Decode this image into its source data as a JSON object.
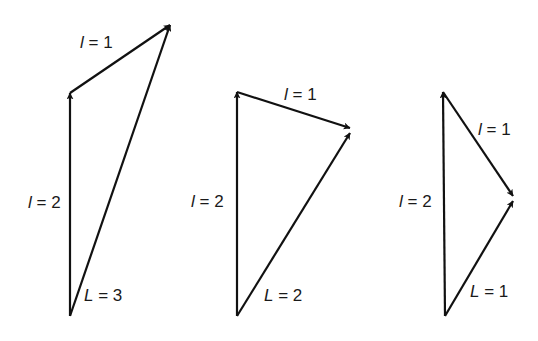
{
  "diagrams": [
    {
      "id": "d1",
      "vectors": [
        {
          "name": "l2",
          "symbol": "l",
          "value": "2",
          "from": [
            70,
            316
          ],
          "to": [
            70,
            93
          ]
        },
        {
          "name": "l1",
          "symbol": "l",
          "value": "1",
          "from": [
            70,
            93
          ],
          "to": [
            170,
            25
          ]
        },
        {
          "name": "L",
          "symbol": "L",
          "value": "3",
          "from": [
            70,
            316
          ],
          "to": [
            170,
            25
          ]
        }
      ],
      "labels": [
        {
          "sym": "l",
          "eq": " = 2",
          "x": 28,
          "y": 208
        },
        {
          "sym": "l",
          "eq": " = 1",
          "x": 80,
          "y": 48
        },
        {
          "sym": "L",
          "eq": " = 3",
          "x": 84,
          "y": 300
        }
      ]
    },
    {
      "id": "d2",
      "vectors": [
        {
          "name": "l2",
          "symbol": "l",
          "value": "2",
          "from": [
            237,
            316
          ],
          "to": [
            237,
            92
          ]
        },
        {
          "name": "l1",
          "symbol": "l",
          "value": "1",
          "from": [
            237,
            92
          ],
          "to": [
            350,
            129
          ]
        },
        {
          "name": "L",
          "symbol": "L",
          "value": "2",
          "from": [
            237,
            316
          ],
          "to": [
            350,
            133
          ]
        }
      ],
      "labels": [
        {
          "sym": "l",
          "eq": " = 2",
          "x": 191,
          "y": 207
        },
        {
          "sym": "l",
          "eq": " = 1",
          "x": 283,
          "y": 102
        },
        {
          "sym": "L",
          "eq": " = 2",
          "x": 264,
          "y": 301
        }
      ]
    },
    {
      "id": "d3",
      "vectors": [
        {
          "name": "l2",
          "symbol": "l",
          "value": "2",
          "from": [
            445,
            316
          ],
          "to": [
            443,
            92
          ]
        },
        {
          "name": "l1",
          "symbol": "l",
          "value": "1",
          "from": [
            443,
            92
          ],
          "to": [
            513,
            197
          ]
        },
        {
          "name": "L",
          "symbol": "L",
          "value": "1",
          "from": [
            445,
            316
          ],
          "to": [
            513,
            201
          ]
        }
      ],
      "labels": [
        {
          "sym": "l",
          "eq": " = 2",
          "x": 399,
          "y": 207
        },
        {
          "sym": "l",
          "eq": " = 1",
          "x": 477,
          "y": 135
        },
        {
          "sym": "L",
          "eq": " = 1",
          "x": 470,
          "y": 297
        }
      ]
    }
  ],
  "text": {
    "d1_l2": "l",
    "d1_l2_eq": " = 2",
    "d1_l1": "l",
    "d1_l1_eq": " = 1",
    "d1_L": "L",
    "d1_L_eq": " = 3",
    "d2_l2": "l",
    "d2_l2_eq": " = 2",
    "d2_l1": "l",
    "d2_l1_eq": " = 1",
    "d2_L": "L",
    "d2_L_eq": " = 2",
    "d3_l2": "l",
    "d3_l2_eq": " = 2",
    "d3_l1": "l",
    "d3_l1_eq": " = 1",
    "d3_L": "L",
    "d3_L_eq": " = 1"
  }
}
